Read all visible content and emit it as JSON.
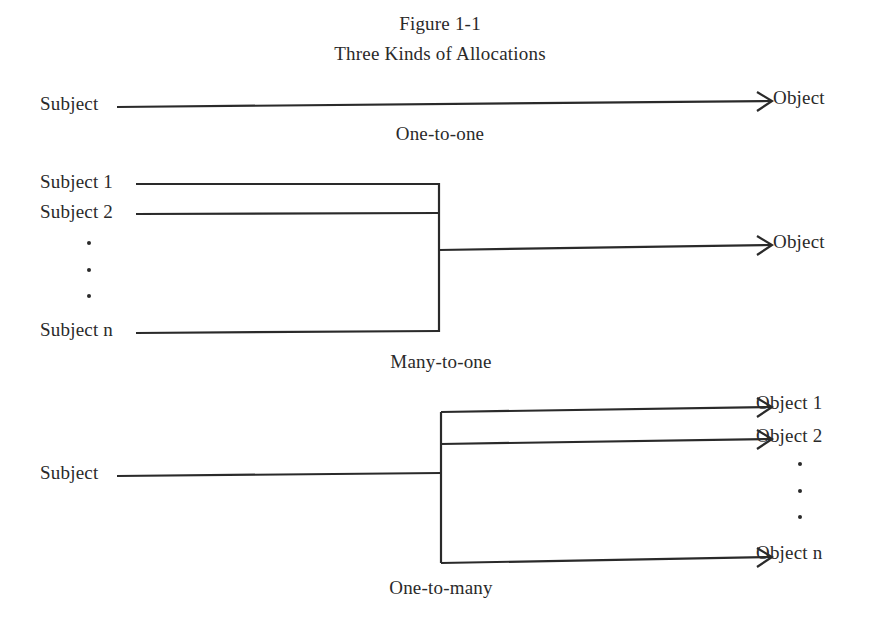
{
  "figure": {
    "number": "Figure 1-1",
    "title": "Three Kinds of Allocations"
  },
  "diagrams": {
    "one_to_one": {
      "caption": "One-to-one",
      "subject": "Subject",
      "object": "Object"
    },
    "many_to_one": {
      "caption": "Many-to-one",
      "subjects": [
        "Subject 1",
        "Subject 2",
        "Subject n"
      ],
      "ellipsis": "⋮",
      "object": "Object"
    },
    "one_to_many": {
      "caption": "One-to-many",
      "subject": "Subject",
      "objects": [
        "Object 1",
        "Object 2",
        "Object n"
      ],
      "ellipsis": "⋮"
    }
  },
  "icons": {
    "arrow": "arrowhead-right-icon"
  }
}
